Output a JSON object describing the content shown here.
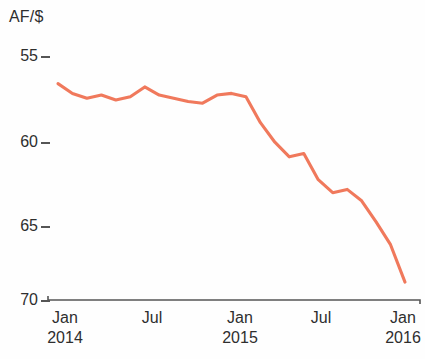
{
  "chart_data": {
    "type": "line",
    "title": "",
    "ylabel": "AF/$",
    "xlabel": "",
    "ylim": [
      55,
      70
    ],
    "y_inverted": true,
    "ytick_labels": [
      "55",
      "60",
      "65",
      "70"
    ],
    "ytick_values": [
      55,
      60,
      65,
      70
    ],
    "xtick_labels": [
      "Jan",
      "Jul",
      "Jan",
      "Jul",
      "Jan"
    ],
    "xtick_years": [
      "2014",
      "",
      "2015",
      "",
      "2016"
    ],
    "grid": false,
    "legend": null,
    "line_color": "#F0795C",
    "axis_color": "#555555",
    "x": [
      "Jan 2014",
      "Feb 2014",
      "Mar 2014",
      "Apr 2014",
      "May 2014",
      "Jun 2014",
      "Jul 2014",
      "Aug 2014",
      "Sep 2014",
      "Oct 2014",
      "Nov 2014",
      "Dec 2014",
      "Jan 2015",
      "Feb 2015",
      "Mar 2015",
      "Apr 2015",
      "May 2015",
      "Jun 2015",
      "Jul 2015",
      "Aug 2015",
      "Sep 2015",
      "Oct 2015",
      "Nov 2015",
      "Dec 2015",
      "Jan 2016"
    ],
    "values": [
      56.7,
      57.3,
      57.6,
      57.4,
      57.7,
      57.5,
      56.9,
      57.4,
      57.6,
      57.8,
      57.9,
      57.4,
      57.3,
      57.5,
      59.1,
      60.3,
      61.2,
      61.0,
      62.6,
      63.4,
      63.2,
      63.9,
      65.2,
      66.6,
      68.9
    ]
  },
  "layout": {
    "plot_left": 48,
    "plot_right": 420,
    "axis_y": 300
  }
}
